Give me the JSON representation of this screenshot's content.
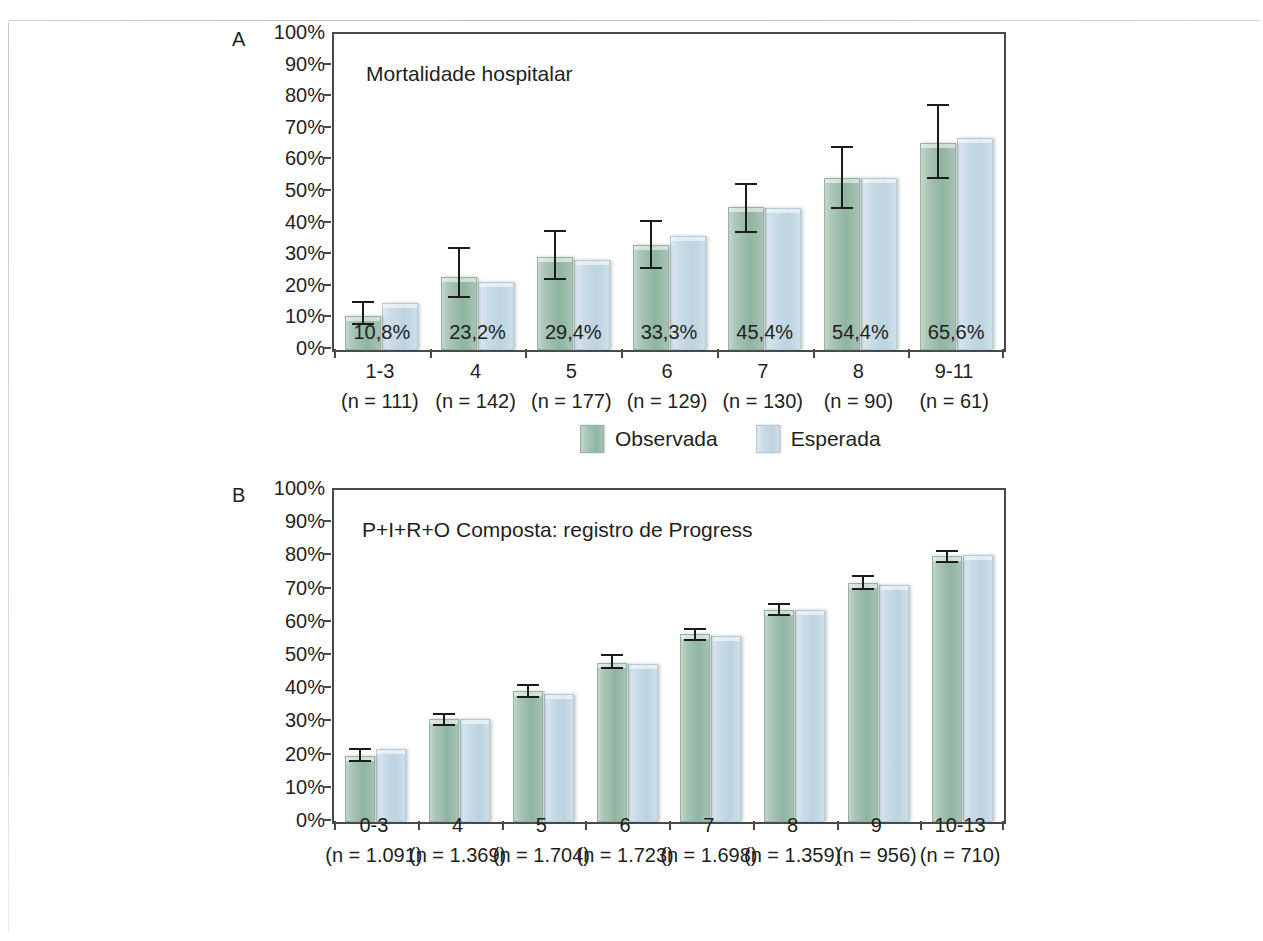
{
  "figure": {
    "panel_a_letter": "A",
    "panel_b_letter": "B",
    "legend_observed": "Observada",
    "legend_expected": "Esperada"
  },
  "colors": {
    "observed": "#9cbbab",
    "expected": "#c6d9e5",
    "axis": "#4a4a4a",
    "error_bar": "#1c1c1c",
    "text": "#231f20"
  },
  "chart_data": [
    {
      "type": "bar",
      "panel": "A",
      "title": "Mortalidade hospitalar",
      "xlabel": "",
      "ylabel": "",
      "ylim": [
        0,
        100
      ],
      "yticks": [
        "0%",
        "10%",
        "20%",
        "30%",
        "40%",
        "50%",
        "60%",
        "70%",
        "80%",
        "90%",
        "100%"
      ],
      "grid": false,
      "legend_position": "bottom-center",
      "categories": [
        "1-3",
        "4",
        "5",
        "6",
        "7",
        "8",
        "9-11"
      ],
      "category_counts": [
        "(n = 111)",
        "(n = 142)",
        "(n = 177)",
        "(n = 129)",
        "(n = 130)",
        "(n = 90)",
        "(n = 61)"
      ],
      "series": [
        {
          "name": "Observada",
          "values": [
            10.8,
            23.2,
            29.4,
            33.3,
            45.4,
            54.4,
            65.6
          ],
          "data_labels": [
            "10,8%",
            "23,2%",
            "29,4%",
            "33,3%",
            "45,4%",
            "54,4%",
            "65,6%"
          ],
          "error_low": [
            8.0,
            16.5,
            22.0,
            25.5,
            37.0,
            44.5,
            54.0
          ],
          "error_high": [
            15.5,
            32.5,
            38.0,
            41.0,
            53.0,
            64.5,
            78.0
          ]
        },
        {
          "name": "Esperada",
          "values": [
            15.0,
            21.5,
            28.5,
            36.0,
            45.0,
            54.5,
            67.0
          ]
        }
      ]
    },
    {
      "type": "bar",
      "panel": "B",
      "title": "P+I+R+O Composta: registro de Progress",
      "xlabel": "",
      "ylabel": "",
      "ylim": [
        0,
        100
      ],
      "yticks": [
        "0%",
        "10%",
        "20%",
        "30%",
        "40%",
        "50%",
        "60%",
        "70%",
        "80%",
        "90%",
        "100%"
      ],
      "grid": false,
      "legend_position": "bottom-center",
      "categories": [
        "0-3",
        "4",
        "5",
        "6",
        "7",
        "8",
        "9",
        "10-13"
      ],
      "category_counts": [
        "(n = 1.091)",
        "(n = 1.369)",
        "(n = 1.704)",
        "(n = 1.723)",
        "(n = 1.698)",
        "(n = 1.359)",
        "(n = 956)",
        "(n = 710)"
      ],
      "series": [
        {
          "name": "Observada",
          "values": [
            19.8,
            31.0,
            39.5,
            48.0,
            56.5,
            64.0,
            72.0,
            80.0
          ],
          "error_low": [
            18.0,
            28.8,
            37.3,
            46.0,
            54.5,
            62.0,
            70.0,
            78.0
          ],
          "error_high": [
            22.3,
            32.8,
            41.5,
            50.5,
            58.5,
            66.0,
            74.5,
            82.0
          ]
        },
        {
          "name": "Esperada",
          "values": [
            22.0,
            31.0,
            38.5,
            47.5,
            56.0,
            64.0,
            71.5,
            80.5
          ]
        }
      ]
    }
  ]
}
